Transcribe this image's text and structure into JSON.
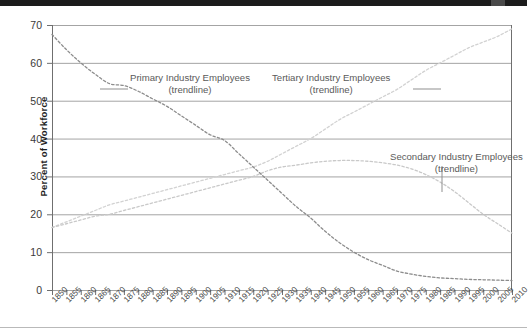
{
  "chart_data": {
    "type": "line",
    "title": "",
    "xlabel": "",
    "ylabel": "Percent of Workforce",
    "xlim": [
      1850,
      2010
    ],
    "ylim": [
      0,
      70
    ],
    "yticks": [
      0,
      10,
      20,
      30,
      40,
      50,
      60,
      70
    ],
    "grid": true,
    "legend_position": "inline-annotations",
    "x": [
      1850,
      1855,
      1860,
      1865,
      1870,
      1875,
      1880,
      1885,
      1890,
      1895,
      1900,
      1905,
      1910,
      1915,
      1920,
      1925,
      1930,
      1935,
      1940,
      1945,
      1950,
      1955,
      1960,
      1965,
      1970,
      1975,
      1980,
      1985,
      1990,
      1995,
      2000,
      2005,
      2010
    ],
    "series": [
      {
        "name": "Primary Industry Employees (trendline)",
        "color": "#8c8c8c",
        "style": "dashed",
        "values": [
          67.5,
          63.5,
          60.0,
          57.0,
          54.5,
          54.0,
          52.5,
          50.5,
          48.5,
          46.0,
          43.5,
          41.0,
          39.5,
          36.0,
          32.5,
          29.0,
          25.5,
          22.0,
          19.0,
          15.5,
          12.5,
          10.0,
          8.0,
          6.5,
          5.0,
          4.2,
          3.6,
          3.2,
          3.0,
          2.8,
          2.7,
          2.6,
          2.5
        ]
      },
      {
        "name": "Secondary Industry Employees (trendline)",
        "color": "#c9c9c9",
        "style": "dashed",
        "values": [
          16.5,
          17.5,
          18.5,
          19.5,
          20.0,
          21.0,
          22.0,
          23.0,
          24.0,
          25.0,
          26.0,
          27.0,
          28.0,
          29.0,
          30.0,
          31.5,
          32.5,
          33.0,
          33.6,
          34.0,
          34.2,
          34.2,
          34.0,
          33.6,
          33.0,
          32.0,
          30.5,
          28.5,
          26.0,
          23.0,
          20.0,
          17.5,
          15.0
        ]
      },
      {
        "name": "Tertiary Industry Employees (trendline)",
        "color": "#d2d2d2",
        "style": "dashed",
        "values": [
          16.5,
          18.0,
          19.5,
          21.0,
          22.5,
          23.5,
          24.5,
          25.5,
          26.5,
          27.5,
          28.5,
          29.5,
          30.5,
          31.5,
          32.5,
          34.0,
          36.0,
          38.0,
          40.0,
          42.5,
          45.0,
          47.0,
          49.0,
          51.0,
          53.0,
          55.5,
          58.0,
          60.0,
          62.0,
          64.0,
          65.5,
          67.0,
          69.0
        ]
      }
    ],
    "annotations": [
      {
        "line1": "Primary Industry Employees",
        "line2": "(trendline)"
      },
      {
        "line1": "Tertiary Industry Employees",
        "line2": "(trendline)"
      },
      {
        "line1": "Secondary Industry Employees",
        "line2": "(trendline)"
      }
    ]
  },
  "axis": {
    "y_title": "Percent of Workforce",
    "y_tick_labels": [
      "70",
      "60",
      "50",
      "40",
      "30",
      "20",
      "10",
      "0"
    ],
    "x_tick_labels": [
      "1850",
      "1855",
      "1860",
      "1865",
      "1870",
      "1875",
      "1880",
      "1885",
      "1890",
      "1895",
      "1900",
      "1905",
      "1910",
      "1915",
      "1920",
      "1925",
      "1930",
      "1935",
      "1940",
      "1945",
      "1950",
      "1955",
      "1960",
      "1965",
      "1970",
      "1975",
      "1980",
      "1985",
      "1990",
      "1995",
      "2000",
      "2005",
      "2010"
    ]
  },
  "annotations": {
    "primary": {
      "line1": "Primary Industry Employees",
      "line2": "(trendline)"
    },
    "tertiary": {
      "line1": "Tertiary Industry Employees",
      "line2": "(trendline)"
    },
    "secondary": {
      "line1": "Secondary Industry Employees",
      "line2": "(trendline)"
    }
  },
  "colors": {
    "primary_series": "#8c8c8c",
    "secondary_series": "#c9c9c9",
    "tertiary_series": "#d2d2d2",
    "grid": "#9a9a9a",
    "axis": "#6f6f6f",
    "text": "#3a3a3a"
  }
}
